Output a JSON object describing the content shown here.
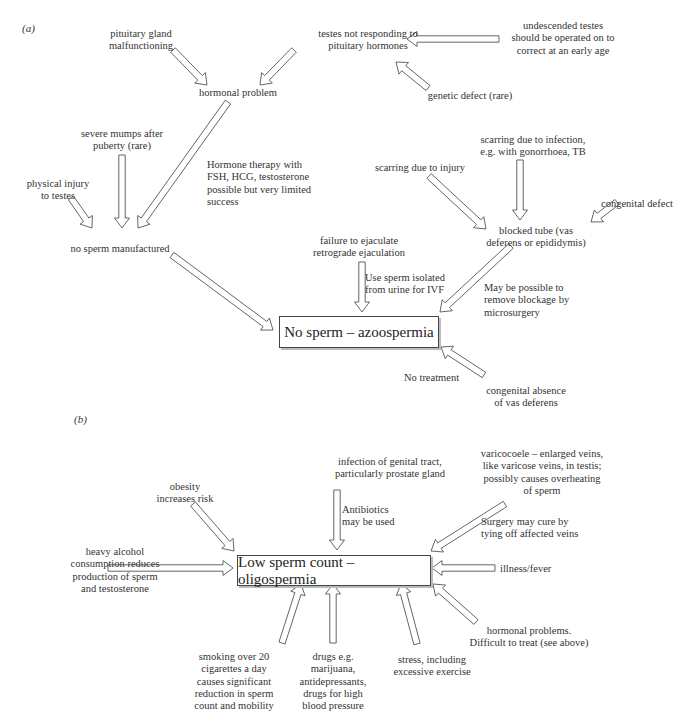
{
  "panel_a": {
    "label": "(a)",
    "outcome": "No sperm – azoospermia",
    "nodes": {
      "pituitary": "pituitary gland\nmalfunctioning",
      "testes_not_responding": "testes not responding to\npituitary hormones",
      "undescended": "undescended testes\nshould be operated on to\ncorrect at an early age",
      "genetic": "genetic defect (rare)",
      "hormonal": "hormonal problem",
      "mumps": "severe mumps after\npuberty (rare)",
      "injury_testes": "physical injury\nto testes",
      "hormone_therapy": "Hormone therapy with\nFSH, HCG, testosterone\npossible but very limited\nsuccess",
      "no_sperm_manufactured": "no sperm manufactured",
      "scarring_infection": "scarring due to infection,\ne.g. with gonorrhoea, TB",
      "scarring_injury": "scarring due to injury",
      "congenital_defect": "congenital defect",
      "blocked_tube": "blocked tube (vas\ndeferens or epididymis)",
      "failure_ejaculate": "failure to ejaculate\nretrograde ejaculation",
      "use_sperm": "Use sperm isolated\nfrom urine for IVF",
      "microsurgery": "May be possible to\nremove blockage by\nmicrosurgery",
      "no_treatment": "No treatment",
      "congenital_absence": "congenital absence\nof vas deferens"
    }
  },
  "panel_b": {
    "label": "(b)",
    "outcome": "Low sperm count – oligospermia",
    "nodes": {
      "infection": "infection of genital tract,\nparticularly prostate gland",
      "antibiotics": "Antibiotics\nmay be used",
      "obesity": "obesity\nincreases risk",
      "varicocoele": "varicocoele – enlarged veins,\nlike varicose veins, in testis;\npossibly causes overheating\nof sperm",
      "surgery": "Surgery may cure by\ntying off affected veins",
      "alcohol": "heavy alcohol\nconsumption reduces\nproduction of sperm\nand testosterone",
      "illness": "illness/fever",
      "hormonal_problems": "hormonal problems.\nDifficult to treat (see above)",
      "smoking": "smoking over 20\ncigarettes a day\ncauses significant\nreduction in sperm\ncount and mobility",
      "drugs": "drugs e.g.\nmarijuana,\nantidepressants,\ndrugs for high\nblood pressure",
      "stress": "stress, including\nexcessive exercise"
    }
  }
}
